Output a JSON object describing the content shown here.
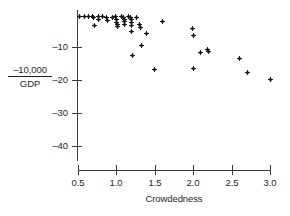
{
  "chart_data": {
    "type": "scatter",
    "title": "",
    "xlabel": "Crowdedness",
    "ylabel": "-10,000 / GDP",
    "ylabel_numerator": "–10,000",
    "ylabel_denominator": "GDP",
    "xlim": [
      0.5,
      3.0
    ],
    "ylim": [
      -45,
      0
    ],
    "grid": false,
    "legend": null,
    "xticks": [
      0.5,
      1.0,
      1.5,
      2.0,
      2.5,
      3.0
    ],
    "xtick_labels": [
      "0.5",
      "1.0",
      "1.5",
      "2.0",
      "2.5",
      "3.0"
    ],
    "yticks": [
      -10,
      -20,
      -30,
      -40
    ],
    "ytick_labels": [
      "–10",
      "–20",
      "–30",
      "–40"
    ],
    "marker": "plus",
    "marker_color": "#1a1a1a",
    "points": [
      {
        "x": 0.52,
        "y": -0.6
      },
      {
        "x": 0.58,
        "y": -0.6
      },
      {
        "x": 0.63,
        "y": -0.7
      },
      {
        "x": 0.69,
        "y": -0.8
      },
      {
        "x": 0.7,
        "y": -1.0
      },
      {
        "x": 0.71,
        "y": -3.5
      },
      {
        "x": 0.76,
        "y": -0.7
      },
      {
        "x": 0.77,
        "y": -1.6
      },
      {
        "x": 0.82,
        "y": -0.8
      },
      {
        "x": 0.87,
        "y": -1.0
      },
      {
        "x": 0.88,
        "y": -1.9
      },
      {
        "x": 0.95,
        "y": -0.9
      },
      {
        "x": 0.99,
        "y": -0.8
      },
      {
        "x": 1.0,
        "y": -1.8
      },
      {
        "x": 1.0,
        "y": -2.6
      },
      {
        "x": 1.01,
        "y": -3.3
      },
      {
        "x": 1.02,
        "y": -3.9
      },
      {
        "x": 1.07,
        "y": -0.8
      },
      {
        "x": 1.09,
        "y": -0.9
      },
      {
        "x": 1.1,
        "y": -1.7
      },
      {
        "x": 1.1,
        "y": -2.4
      },
      {
        "x": 1.11,
        "y": -3.1
      },
      {
        "x": 1.16,
        "y": -0.8
      },
      {
        "x": 1.18,
        "y": -1.0
      },
      {
        "x": 1.19,
        "y": -1.8
      },
      {
        "x": 1.2,
        "y": -2.6
      },
      {
        "x": 1.2,
        "y": -3.4
      },
      {
        "x": 1.2,
        "y": -5.2
      },
      {
        "x": 1.21,
        "y": -12.5
      },
      {
        "x": 1.26,
        "y": -0.9
      },
      {
        "x": 1.3,
        "y": -3.3
      },
      {
        "x": 1.31,
        "y": -4.2
      },
      {
        "x": 1.32,
        "y": -9.4
      },
      {
        "x": 1.39,
        "y": -5.8
      },
      {
        "x": 1.5,
        "y": -16.8
      },
      {
        "x": 1.6,
        "y": -2.3
      },
      {
        "x": 1.99,
        "y": -4.3
      },
      {
        "x": 2.0,
        "y": -6.6
      },
      {
        "x": 2.0,
        "y": -16.6
      },
      {
        "x": 2.1,
        "y": -11.7
      },
      {
        "x": 2.19,
        "y": -10.6
      },
      {
        "x": 2.2,
        "y": -11.3
      },
      {
        "x": 2.6,
        "y": -13.4
      },
      {
        "x": 2.7,
        "y": -17.8
      },
      {
        "x": 3.0,
        "y": -19.8
      }
    ]
  }
}
